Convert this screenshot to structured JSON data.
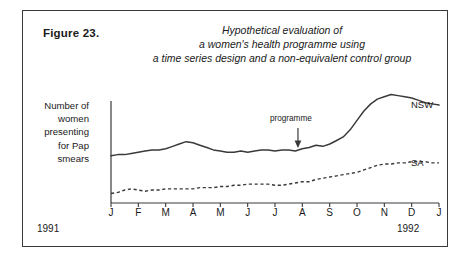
{
  "figure": {
    "label": "Figure 23.",
    "title_lines": [
      "Hypothetical evaluation of",
      "a women's health programme using",
      "a time series design and a non-equivalent control group"
    ]
  },
  "axes": {
    "y_label_lines": [
      "Number of",
      "women",
      "presenting",
      "for Pap",
      "smears"
    ],
    "x_tick_labels": [
      "J",
      "F",
      "M",
      "A",
      "M",
      "J",
      "J",
      "A",
      "S",
      "O",
      "N",
      "D",
      "J"
    ],
    "year_start": "1991",
    "year_end": "1992"
  },
  "annotations": {
    "programme": "programme"
  },
  "series_labels": {
    "nsw": "NSW",
    "sa": "SA"
  },
  "colors": {
    "line": "#3a3a3a",
    "frame": "#3a3a3a",
    "text": "#1a1a1a",
    "background": "#ffffff"
  },
  "chart_data": {
    "type": "line",
    "title": "Hypothetical evaluation of a women's health programme using a time series design and a non-equivalent control group",
    "xlabel": "",
    "ylabel": "Number of women presenting for Pap smears",
    "grid": false,
    "legend": "inline-right-end-of-line",
    "x_axis_range": [
      "1991-01",
      "1992-01"
    ],
    "x_tick_labels": [
      "J",
      "F",
      "M",
      "A",
      "M",
      "J",
      "J",
      "A",
      "S",
      "O",
      "N",
      "D",
      "J"
    ],
    "y_axis_ticks_shown": false,
    "intervention": {
      "label": "programme",
      "at_x_fraction": 0.57,
      "note": "arrow marks start of programme, between J (Jul) and A (Aug) 1991"
    },
    "series": [
      {
        "name": "NSW",
        "style": "solid",
        "note": "treatment group; flat pre-intervention, sharp rise after programme, plateau then slight decline",
        "x_fraction": [
          0.0,
          0.021,
          0.042,
          0.062,
          0.083,
          0.104,
          0.125,
          0.146,
          0.167,
          0.188,
          0.208,
          0.229,
          0.25,
          0.271,
          0.292,
          0.312,
          0.333,
          0.354,
          0.375,
          0.396,
          0.417,
          0.438,
          0.458,
          0.479,
          0.5,
          0.521,
          0.542,
          0.562,
          0.583,
          0.604,
          0.625,
          0.646,
          0.667,
          0.688,
          0.708,
          0.729,
          0.75,
          0.771,
          0.792,
          0.812,
          0.833,
          0.854,
          0.875,
          0.896,
          0.917,
          0.938,
          0.958,
          0.979,
          1.0
        ],
        "values": [
          40,
          41,
          41,
          42,
          43,
          44,
          45,
          45,
          46,
          48,
          50,
          52,
          51,
          49,
          47,
          45,
          44,
          43,
          43,
          44,
          43,
          44,
          45,
          45,
          44,
          45,
          45,
          44,
          46,
          47,
          49,
          48,
          50,
          53,
          56,
          62,
          70,
          78,
          84,
          88,
          90,
          92,
          91,
          90,
          89,
          87,
          85,
          84,
          83
        ],
        "ylim": [
          0,
          100
        ]
      },
      {
        "name": "SA",
        "style": "dashed",
        "note": "non-equivalent control group; gradual upward drift throughout, no step at intervention",
        "x_fraction": [
          0.0,
          0.021,
          0.042,
          0.062,
          0.083,
          0.104,
          0.125,
          0.146,
          0.167,
          0.188,
          0.208,
          0.229,
          0.25,
          0.271,
          0.292,
          0.312,
          0.333,
          0.354,
          0.375,
          0.396,
          0.417,
          0.438,
          0.458,
          0.479,
          0.5,
          0.521,
          0.542,
          0.562,
          0.583,
          0.604,
          0.625,
          0.646,
          0.667,
          0.688,
          0.708,
          0.729,
          0.75,
          0.771,
          0.792,
          0.812,
          0.833,
          0.854,
          0.875,
          0.896,
          0.917,
          0.938,
          0.958,
          0.979,
          1.0
        ],
        "values": [
          8,
          9,
          11,
          12,
          11,
          10,
          11,
          11,
          12,
          12,
          12,
          12,
          12,
          13,
          13,
          13,
          14,
          14,
          15,
          15,
          16,
          16,
          16,
          16,
          15,
          15,
          16,
          17,
          18,
          18,
          20,
          21,
          22,
          23,
          24,
          25,
          26,
          28,
          30,
          32,
          33,
          33,
          34,
          34,
          35,
          35,
          35,
          34,
          34
        ],
        "ylim": [
          0,
          100
        ]
      }
    ]
  }
}
